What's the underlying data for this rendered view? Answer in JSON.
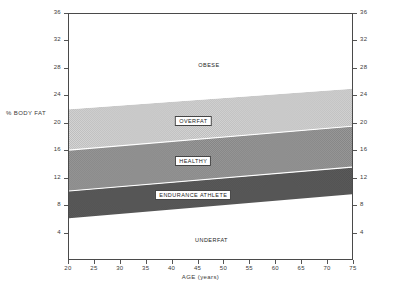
{
  "chart_data": {
    "type": "area",
    "title": "",
    "xlabel": "AGE (years)",
    "ylabel": "% BODY FAT",
    "xlim": [
      20,
      75
    ],
    "ylim": [
      0,
      36
    ],
    "grid": false,
    "legend_position": "in-plot-labels",
    "x_ticks": [
      20,
      25,
      30,
      35,
      40,
      45,
      50,
      55,
      60,
      65,
      70,
      75
    ],
    "y_ticks": [
      4,
      8,
      12,
      16,
      20,
      24,
      28,
      32,
      36
    ],
    "y_ticks_right": [
      4,
      8,
      12,
      16,
      20,
      24,
      28,
      32,
      36
    ],
    "x": [
      20,
      75
    ],
    "boundaries": [
      {
        "name": "underfat_top",
        "values": [
          6.0,
          9.5
        ]
      },
      {
        "name": "endurance_athlete_top",
        "values": [
          10.0,
          13.5
        ]
      },
      {
        "name": "healthy_top",
        "values": [
          16.0,
          19.5
        ]
      },
      {
        "name": "overfat_top",
        "values": [
          22.0,
          25.0
        ]
      }
    ],
    "bands": [
      {
        "label": "UNDERFAT",
        "label_style": "plain",
        "color": "#ffffff",
        "y_lower": [
          0.0,
          0.0
        ],
        "y_upper": [
          6.0,
          9.5
        ],
        "label_x": 47.5,
        "label_y": 3.0
      },
      {
        "label": "ENDURANCE ATHLETE",
        "label_style": "boxed",
        "color": "#565656",
        "y_lower": [
          6.0,
          9.5
        ],
        "y_upper": [
          10.0,
          13.5
        ],
        "label_x": 44.0,
        "label_y": 9.6
      },
      {
        "label": "HEALTHY",
        "label_style": "boxed",
        "color": "#8e8e8e",
        "y_lower": [
          10.0,
          13.5
        ],
        "y_upper": [
          16.0,
          19.5
        ],
        "label_x": 44.0,
        "label_y": 14.6
      },
      {
        "label": "OVERFAT",
        "label_style": "boxed",
        "color": "#c9c9c9",
        "y_lower": [
          16.0,
          19.5
        ],
        "y_upper": [
          22.0,
          25.0
        ],
        "label_x": 44.0,
        "label_y": 20.4
      },
      {
        "label": "OBESE",
        "label_style": "plain",
        "color": "#ffffff",
        "y_lower": [
          22.0,
          25.0
        ],
        "y_upper": [
          36.0,
          36.0
        ],
        "label_x": 47.0,
        "label_y": 28.6
      }
    ],
    "colors": {
      "axis": "#4a4a4a",
      "text": "#2a2a2a",
      "overfat": "#c9c9c9",
      "healthy": "#8e8e8e",
      "endurance_athlete": "#565656",
      "underfat": "#ffffff",
      "obese": "#ffffff",
      "separator": "#ffffff"
    }
  }
}
